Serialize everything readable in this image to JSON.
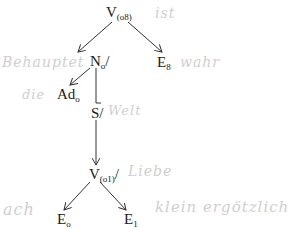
{
  "diagram": {
    "type": "tree",
    "nodes": [
      {
        "id": "v08",
        "label": "V",
        "sub": "(o8)"
      },
      {
        "id": "n0",
        "label": "N",
        "sub": "o",
        "suffix": "/"
      },
      {
        "id": "e8",
        "label": "E",
        "sub": "8"
      },
      {
        "id": "ad0",
        "label": "Ad",
        "sub": "o"
      },
      {
        "id": "s",
        "label": "S",
        "suffix": "/"
      },
      {
        "id": "v01",
        "label": "V",
        "sub": "(o1)",
        "suffix": "/"
      },
      {
        "id": "e0",
        "label": "E",
        "sub": "o"
      },
      {
        "id": "e1",
        "label": "E",
        "sub": "1"
      }
    ],
    "edges": [
      {
        "from": "v08",
        "to": "n0"
      },
      {
        "from": "v08",
        "to": "e8"
      },
      {
        "from": "n0",
        "to": "ad0"
      },
      {
        "from": "n0",
        "to": "s"
      },
      {
        "from": "s",
        "to": "v01"
      },
      {
        "from": "v01",
        "to": "e0"
      },
      {
        "from": "v01",
        "to": "e1"
      }
    ]
  },
  "handwriting": {
    "h1": "ist",
    "h2": "Behauptet",
    "h3": "wahr",
    "h4": "die",
    "h5": "Welt",
    "h6": "Liebe",
    "h7": "ach",
    "h8": "klein ergötzlich"
  }
}
